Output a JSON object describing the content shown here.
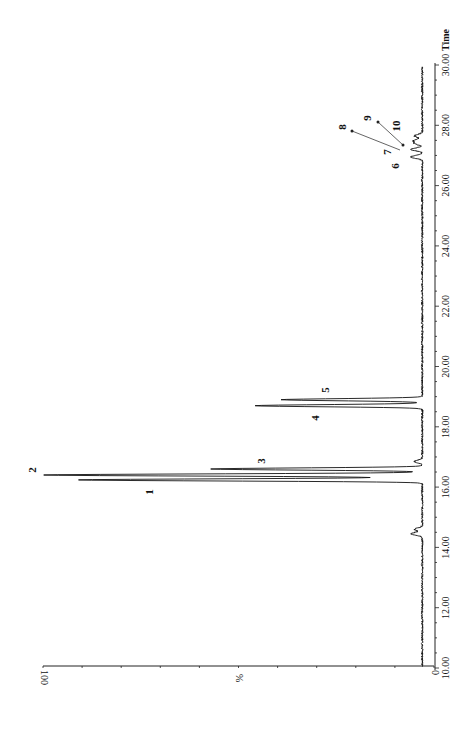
{
  "chart_data": {
    "type": "line",
    "title": "",
    "orientation": "rotated 90 degrees clockwise (time axis vertical on right, intensity axis horizontal along bottom)",
    "xlabel": "Time",
    "ylabel": "%",
    "xlim": [
      10.0,
      30.0
    ],
    "ylim": [
      0,
      100
    ],
    "x_ticks": [
      "10.00",
      "12.00",
      "14.00",
      "16.00",
      "18.00",
      "20.00",
      "22.00",
      "24.00",
      "26.00",
      "28.00",
      "30.00"
    ],
    "y_ticks": [
      "0",
      "100"
    ],
    "grid": false,
    "baseline_percent": 3,
    "peaks": [
      {
        "label": "",
        "time": 14.45,
        "intensity": 6
      },
      {
        "label": "",
        "time": 14.6,
        "intensity": 5
      },
      {
        "label": "1",
        "time": 16.24,
        "intensity": 91
      },
      {
        "label": "2",
        "time": 16.4,
        "intensity": 100
      },
      {
        "label": "3",
        "time": 16.6,
        "intensity": 57
      },
      {
        "label": "",
        "time": 16.85,
        "intensity": 5
      },
      {
        "label": "4",
        "time": 18.7,
        "intensity": 46
      },
      {
        "label": "5",
        "time": 18.9,
        "intensity": 39
      },
      {
        "label": "6",
        "time": 26.95,
        "intensity": 6
      },
      {
        "label": "7",
        "time": 27.2,
        "intensity": 6
      },
      {
        "label": "8",
        "time": 27.4,
        "intensity": 5
      },
      {
        "label": "9",
        "time": 27.5,
        "intensity": 5
      },
      {
        "label": "10",
        "time": 27.65,
        "intensity": 5
      }
    ]
  },
  "axis": {
    "time_label": "Time",
    "intensity_label": "%",
    "intensity_max": "100",
    "intensity_min": "0"
  },
  "peak_labels": [
    "1",
    "2",
    "3",
    "4",
    "5",
    "6",
    "7",
    "8",
    "9",
    "10"
  ]
}
